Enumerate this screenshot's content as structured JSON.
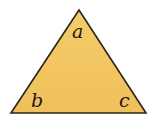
{
  "diagram": {
    "shape": "triangle",
    "fill_color": "#F2C763",
    "stroke_color": "#2a2418",
    "vertices": {
      "top": [
        79,
        10
      ],
      "bottom_left": [
        11,
        113
      ],
      "bottom_right": [
        146,
        113
      ]
    },
    "angle_labels": {
      "top": "a",
      "bottom_left": "b",
      "bottom_right": "c"
    }
  }
}
